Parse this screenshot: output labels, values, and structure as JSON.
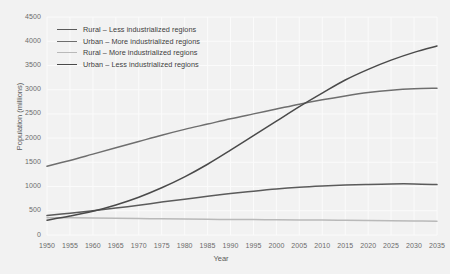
{
  "chart_data": {
    "type": "line",
    "title": "",
    "xlabel": "Year",
    "ylabel": "Population (millions)",
    "xlim": [
      1950,
      2035
    ],
    "ylim": [
      0,
      4500
    ],
    "grid": true,
    "legend_position": "top-left",
    "x_ticks": [
      1950,
      1955,
      1960,
      1965,
      1970,
      1975,
      1980,
      1985,
      1990,
      1995,
      2000,
      2005,
      2010,
      2015,
      2020,
      2025,
      2030,
      2035
    ],
    "y_ticks": [
      0,
      500,
      1000,
      1500,
      2000,
      2500,
      3000,
      3500,
      4000,
      4500
    ],
    "x": [
      1950,
      1955,
      1960,
      1965,
      1970,
      1975,
      1980,
      1985,
      1990,
      1995,
      2000,
      2005,
      2010,
      2015,
      2020,
      2025,
      2030,
      2035
    ],
    "series": [
      {
        "name": "Rural – Less industrialized regions",
        "color": "#5b5b5b",
        "width": 1.5,
        "values": [
          400,
          450,
          500,
          555,
          615,
          680,
          740,
          800,
          855,
          905,
          950,
          985,
          1010,
          1030,
          1045,
          1055,
          1055,
          1040
        ]
      },
      {
        "name": "Urban – More industrialized regions",
        "color": "#6e6e6e",
        "width": 1.5,
        "values": [
          1420,
          1540,
          1670,
          1800,
          1930,
          2060,
          2180,
          2290,
          2400,
          2500,
          2600,
          2700,
          2790,
          2870,
          2940,
          2990,
          3020,
          3030
        ]
      },
      {
        "name": "Rural – More industrialized regions",
        "color": "#b9b9b9",
        "width": 1.5,
        "values": [
          355,
          355,
          350,
          345,
          340,
          335,
          330,
          325,
          320,
          318,
          315,
          312,
          310,
          305,
          300,
          295,
          290,
          285
        ]
      },
      {
        "name": "Urban – Less industrialized regions",
        "color": "#4a4a4a",
        "width": 1.5,
        "values": [
          305,
          390,
          490,
          620,
          780,
          975,
          1200,
          1460,
          1750,
          2050,
          2350,
          2650,
          2930,
          3200,
          3420,
          3610,
          3770,
          3900
        ]
      }
    ],
    "legend": [
      {
        "label": "Rural – Less industrialized regions",
        "color": "#5b5b5b"
      },
      {
        "label": "Urban – More industrialized regions",
        "color": "#6e6e6e"
      },
      {
        "label": "Rural – More industrialized regions",
        "color": "#b9b9b9"
      },
      {
        "label": "Urban – Less industrialized regions",
        "color": "#4a4a4a"
      }
    ],
    "colors": {
      "background": "#f2f2f2",
      "gridline": "#fbfbfb",
      "tick_text": "#6b6b6b",
      "axis_title": "#5a5a5a"
    }
  }
}
